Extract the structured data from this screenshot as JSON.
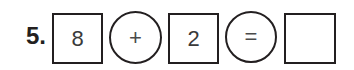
{
  "problem": {
    "number": "5.",
    "operand1": "8",
    "operator": "+",
    "operand2": "2",
    "equals": "=",
    "answer": ""
  },
  "colors": {
    "stroke": "#231f20",
    "text": "#3a3a3a",
    "background": "#ffffff"
  }
}
